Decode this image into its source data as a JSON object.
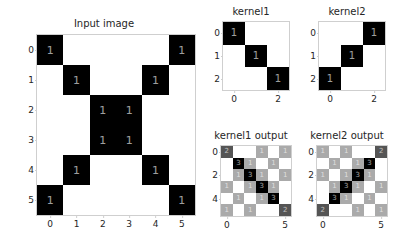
{
  "figure": {
    "background": "#ffffff",
    "text_color": "#262626",
    "tick_color": "#cfcfcf"
  },
  "chart_data": [
    {
      "type": "heatmap",
      "name": "input-image",
      "title": "Input image",
      "xlabel": "",
      "ylabel": "",
      "cmap": "gray_r",
      "vmin": 0,
      "vmax": 1,
      "grid": false,
      "xticks": [
        "0",
        "1",
        "2",
        "3",
        "4",
        "5"
      ],
      "yticks": [
        "0",
        "1",
        "2",
        "3",
        "4",
        "5"
      ],
      "annotate": true,
      "annotate_min": 1,
      "values": [
        [
          1,
          0,
          0,
          0,
          0,
          1
        ],
        [
          0,
          1,
          0,
          0,
          1,
          0
        ],
        [
          0,
          0,
          1,
          1,
          0,
          0
        ],
        [
          0,
          0,
          1,
          1,
          0,
          0
        ],
        [
          0,
          1,
          0,
          0,
          1,
          0
        ],
        [
          1,
          0,
          0,
          0,
          0,
          1
        ]
      ],
      "colors": [
        [
          "#000000",
          "#ffffff",
          "#ffffff",
          "#ffffff",
          "#ffffff",
          "#000000"
        ],
        [
          "#ffffff",
          "#000000",
          "#ffffff",
          "#ffffff",
          "#000000",
          "#ffffff"
        ],
        [
          "#ffffff",
          "#ffffff",
          "#000000",
          "#000000",
          "#ffffff",
          "#ffffff"
        ],
        [
          "#ffffff",
          "#ffffff",
          "#000000",
          "#000000",
          "#ffffff",
          "#ffffff"
        ],
        [
          "#ffffff",
          "#000000",
          "#ffffff",
          "#ffffff",
          "#000000",
          "#ffffff"
        ],
        [
          "#000000",
          "#ffffff",
          "#ffffff",
          "#ffffff",
          "#ffffff",
          "#000000"
        ]
      ],
      "text_colors": [
        [
          "#ffffff",
          "",
          "",
          "",
          "",
          "#ffffff"
        ],
        [
          "",
          "#ffffff",
          "",
          "",
          "#ffffff",
          ""
        ],
        [
          "",
          "",
          "#ffffff",
          "#ffffff",
          "",
          ""
        ],
        [
          "",
          "",
          "#ffffff",
          "#ffffff",
          "",
          ""
        ],
        [
          "",
          "#ffffff",
          "",
          "",
          "#ffffff",
          ""
        ],
        [
          "#ffffff",
          "",
          "",
          "",
          "",
          "#ffffff"
        ]
      ]
    },
    {
      "type": "heatmap",
      "name": "kernel1",
      "title": "kernel1",
      "xlabel": "",
      "ylabel": "",
      "cmap": "gray_r",
      "vmin": 0,
      "vmax": 1,
      "grid": false,
      "xticks": [
        "0",
        "2"
      ],
      "xtick_positions": [
        0,
        2
      ],
      "yticks": [
        "0",
        "1",
        "2"
      ],
      "annotate": true,
      "annotate_min": 1,
      "values": [
        [
          1,
          0,
          0
        ],
        [
          0,
          1,
          0
        ],
        [
          0,
          0,
          1
        ]
      ],
      "colors": [
        [
          "#000000",
          "#ffffff",
          "#ffffff"
        ],
        [
          "#ffffff",
          "#000000",
          "#ffffff"
        ],
        [
          "#ffffff",
          "#ffffff",
          "#000000"
        ]
      ],
      "text_colors": [
        [
          "#ffffff",
          "",
          ""
        ],
        [
          "",
          "#ffffff",
          ""
        ],
        [
          "",
          "",
          "#ffffff"
        ]
      ]
    },
    {
      "type": "heatmap",
      "name": "kernel2",
      "title": "kernel2",
      "xlabel": "",
      "ylabel": "",
      "cmap": "gray_r",
      "vmin": 0,
      "vmax": 1,
      "grid": false,
      "xticks": [
        "0",
        "2"
      ],
      "xtick_positions": [
        0,
        2
      ],
      "yticks": [
        "0",
        "1",
        "2"
      ],
      "annotate": true,
      "annotate_min": 1,
      "values": [
        [
          0,
          0,
          1
        ],
        [
          0,
          1,
          0
        ],
        [
          1,
          0,
          0
        ]
      ],
      "colors": [
        [
          "#ffffff",
          "#ffffff",
          "#000000"
        ],
        [
          "#ffffff",
          "#000000",
          "#ffffff"
        ],
        [
          "#000000",
          "#ffffff",
          "#ffffff"
        ]
      ],
      "text_colors": [
        [
          "",
          "",
          "#ffffff"
        ],
        [
          "",
          "#ffffff",
          ""
        ],
        [
          "#ffffff",
          "",
          ""
        ]
      ]
    },
    {
      "type": "heatmap",
      "name": "kernel1-output",
      "title": "kernel1 output",
      "xlabel": "",
      "ylabel": "",
      "cmap": "gray_r",
      "vmin": 0,
      "vmax": 3,
      "grid": false,
      "xticks": [
        "0",
        "5"
      ],
      "xtick_positions": [
        0,
        5
      ],
      "yticks": [
        "0",
        "2",
        "4"
      ],
      "ytick_positions": [
        0,
        2,
        4
      ],
      "annotate": true,
      "annotate_min": 1,
      "values": [
        [
          2,
          0,
          0,
          1,
          0,
          1
        ],
        [
          0,
          3,
          1,
          0,
          1,
          0
        ],
        [
          0,
          1,
          3,
          1,
          0,
          1
        ],
        [
          1,
          0,
          1,
          3,
          1,
          0
        ],
        [
          0,
          1,
          0,
          1,
          3,
          0
        ],
        [
          1,
          0,
          1,
          0,
          0,
          2
        ]
      ],
      "colors": [
        [
          "#555555",
          "#ffffff",
          "#ffffff",
          "#aaaaaa",
          "#ffffff",
          "#aaaaaa"
        ],
        [
          "#ffffff",
          "#000000",
          "#aaaaaa",
          "#ffffff",
          "#aaaaaa",
          "#ffffff"
        ],
        [
          "#ffffff",
          "#aaaaaa",
          "#000000",
          "#aaaaaa",
          "#ffffff",
          "#aaaaaa"
        ],
        [
          "#aaaaaa",
          "#ffffff",
          "#aaaaaa",
          "#000000",
          "#aaaaaa",
          "#ffffff"
        ],
        [
          "#ffffff",
          "#aaaaaa",
          "#ffffff",
          "#aaaaaa",
          "#000000",
          "#ffffff"
        ],
        [
          "#aaaaaa",
          "#ffffff",
          "#aaaaaa",
          "#ffffff",
          "#ffffff",
          "#555555"
        ]
      ],
      "text_colors": [
        [
          "#ffffff",
          "",
          "",
          "#ffffff",
          "",
          "#ffffff"
        ],
        [
          "",
          "#ffffff",
          "#ffffff",
          "",
          "#ffffff",
          ""
        ],
        [
          "",
          "#ffffff",
          "#ffffff",
          "#ffffff",
          "",
          "#ffffff"
        ],
        [
          "#ffffff",
          "",
          "#ffffff",
          "#ffffff",
          "#ffffff",
          ""
        ],
        [
          "",
          "#ffffff",
          "",
          "#ffffff",
          "#ffffff",
          ""
        ],
        [
          "#ffffff",
          "",
          "#ffffff",
          "",
          "",
          "#ffffff"
        ]
      ]
    },
    {
      "type": "heatmap",
      "name": "kernel2-output",
      "title": "kernel2 output",
      "xlabel": "",
      "ylabel": "",
      "cmap": "gray_r",
      "vmin": 0,
      "vmax": 3,
      "grid": false,
      "xticks": [
        "0",
        "5"
      ],
      "xtick_positions": [
        0,
        5
      ],
      "yticks": [
        "0",
        "2",
        "4"
      ],
      "ytick_positions": [
        0,
        2,
        4
      ],
      "annotate": true,
      "annotate_min": 1,
      "values": [
        [
          1,
          0,
          1,
          0,
          0,
          2
        ],
        [
          0,
          1,
          0,
          1,
          3,
          0
        ],
        [
          1,
          0,
          1,
          3,
          1,
          0
        ],
        [
          0,
          1,
          3,
          1,
          0,
          1
        ],
        [
          0,
          3,
          1,
          0,
          1,
          0
        ],
        [
          2,
          0,
          0,
          1,
          0,
          1
        ]
      ],
      "colors": [
        [
          "#aaaaaa",
          "#ffffff",
          "#aaaaaa",
          "#ffffff",
          "#ffffff",
          "#555555"
        ],
        [
          "#ffffff",
          "#aaaaaa",
          "#ffffff",
          "#aaaaaa",
          "#000000",
          "#ffffff"
        ],
        [
          "#aaaaaa",
          "#ffffff",
          "#aaaaaa",
          "#000000",
          "#aaaaaa",
          "#ffffff"
        ],
        [
          "#ffffff",
          "#aaaaaa",
          "#000000",
          "#aaaaaa",
          "#ffffff",
          "#aaaaaa"
        ],
        [
          "#ffffff",
          "#000000",
          "#aaaaaa",
          "#ffffff",
          "#aaaaaa",
          "#ffffff"
        ],
        [
          "#555555",
          "#ffffff",
          "#ffffff",
          "#aaaaaa",
          "#ffffff",
          "#aaaaaa"
        ]
      ],
      "text_colors": [
        [
          "#ffffff",
          "",
          "#ffffff",
          "",
          "",
          "#ffffff"
        ],
        [
          "",
          "#ffffff",
          "",
          "#ffffff",
          "#ffffff",
          ""
        ],
        [
          "#ffffff",
          "",
          "#ffffff",
          "#ffffff",
          "#ffffff",
          ""
        ],
        [
          "",
          "#ffffff",
          "#ffffff",
          "#ffffff",
          "",
          "#ffffff"
        ],
        [
          "",
          "#ffffff",
          "#ffffff",
          "",
          "#ffffff",
          ""
        ],
        [
          "#ffffff",
          "",
          "",
          "#ffffff",
          "",
          "#ffffff"
        ]
      ]
    }
  ]
}
